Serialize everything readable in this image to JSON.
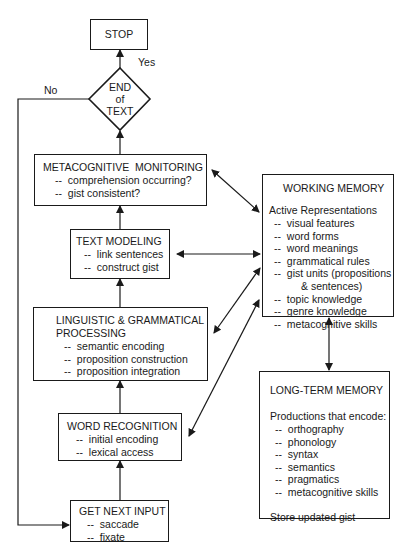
{
  "stop": {
    "label": "STOP"
  },
  "decision": {
    "lines": [
      "END",
      "of",
      "TEXT"
    ],
    "yes_label": "Yes",
    "no_label": "No"
  },
  "metacognitive_monitoring": {
    "title": "METACOGNITIVE  MONITORING",
    "items": [
      "comprehension occurring?",
      "gist consistent?"
    ]
  },
  "text_modeling": {
    "title": "TEXT MODELING",
    "items": [
      "link sentences",
      "construct gist"
    ]
  },
  "linguistic_processing": {
    "title_line1": "LINGUISTIC & GRAMMATICAL",
    "title_line2": "PROCESSING",
    "items": [
      "semantic encoding",
      "proposition construction",
      "proposition integration"
    ]
  },
  "word_recognition": {
    "title": "WORD RECOGNITION",
    "items": [
      "initial encoding",
      "lexical access"
    ]
  },
  "get_next_input": {
    "title": "GET NEXT INPUT",
    "items": [
      "saccade",
      "fixate"
    ]
  },
  "working_memory": {
    "title": "WORKING MEMORY",
    "subtitle": "Active Representations",
    "items": [
      "visual features",
      "word forms",
      "word meanings",
      "grammatical rules",
      "gist units (propositions",
      "topic knowledge",
      "genre knowledge",
      "metacognitive skills"
    ],
    "continuation": "& sentences)"
  },
  "long_term_memory": {
    "title": "LONG-TERM MEMORY",
    "subtitle": "Productions that encode:",
    "items": [
      "orthography",
      "phonology",
      "syntax",
      "semantics",
      "pragmatics",
      "metacognitive skills"
    ],
    "footer": "Store updated gist"
  }
}
